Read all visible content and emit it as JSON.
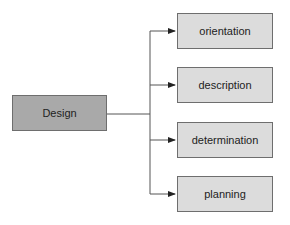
{
  "diagram": {
    "root": {
      "label": "Design"
    },
    "children": [
      {
        "label": "orientation"
      },
      {
        "label": "description"
      },
      {
        "label": "determination"
      },
      {
        "label": "planning"
      }
    ]
  },
  "colors": {
    "root_fill": "#a9a9a9",
    "child_fill": "#dcdcdc",
    "border": "#6e6e6e",
    "connector": "#555555"
  }
}
